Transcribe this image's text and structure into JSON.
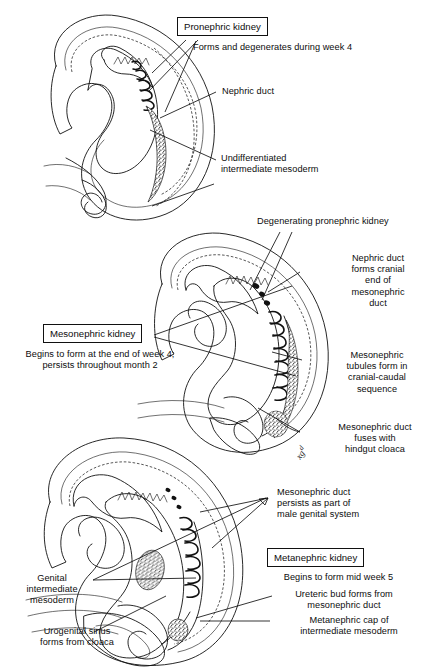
{
  "figure": {
    "line_color": "#111111",
    "background_color": "#ffffff"
  },
  "panels": [
    {
      "id": "pronephric-stage",
      "stage_name": "Pronephric kidney stage (week 4)",
      "boxed_label": "Pronephric kidney",
      "labels": [
        {
          "name": "forms-degenerates",
          "text": "Forms and degenerates during week 4"
        },
        {
          "name": "nephric-duct",
          "text": "Nephric duct"
        },
        {
          "name": "undifferentiated-intermediate-mesoderm",
          "text": "Undifferentiated\nintermediate mesoderm"
        }
      ]
    },
    {
      "id": "mesonephric-stage",
      "stage_name": "Mesonephric kidney stage (end of week 4 through month 2)",
      "boxed_label": "Mesonephric kidney",
      "labels": [
        {
          "name": "degenerating-pronephric-kidney",
          "text": "Degenerating pronephric kidney"
        },
        {
          "name": "nephric-duct-forms-cranial-end",
          "text": "Nephric duct\nforms cranial\nend of\nmesonephric\nduct"
        },
        {
          "name": "mesonephric-kidney-caption",
          "text": "Begins to form at the end of week 4;\npersists throughout month 2"
        },
        {
          "name": "mesonephric-tubules",
          "text": "Mesonephric\ntubules form in\ncranial-caudal\nsequence"
        },
        {
          "name": "mesonephric-duct-fuses",
          "text": "Mesonephric duct\nfuses with\nhindgut cloaca"
        }
      ]
    },
    {
      "id": "metanephric-stage",
      "stage_name": "Metanephric kidney stage (mid week 5)",
      "boxed_label": "Metanephric kidney",
      "labels": [
        {
          "name": "mesonephric-duct-persists",
          "text": "Mesonephric duct\npersists as part of\nmale genital system"
        },
        {
          "name": "genital-intermediate-mesoderm",
          "text": "Genital\nintermediate\nmesoderm"
        },
        {
          "name": "metanephric-kidney-caption",
          "text": "Begins to form mid week 5"
        },
        {
          "name": "ureteric-bud",
          "text": "Ureteric bud forms from\nmesonephric duct"
        },
        {
          "name": "metanephric-cap",
          "text": "Metanephric cap of\nintermediate mesoderm"
        },
        {
          "name": "urogenital-sinus",
          "text": "Urogenital sinus\nforms from cloaca"
        }
      ]
    }
  ]
}
